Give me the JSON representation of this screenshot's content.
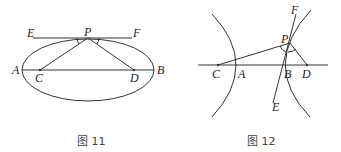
{
  "figures": [
    {
      "caption": "图 11",
      "type": "ellipse",
      "labels": {
        "E": "E",
        "P": "P",
        "F": "F",
        "A": "A",
        "B": "B",
        "C": "C",
        "D": "D"
      }
    },
    {
      "caption": "图 12",
      "type": "hyperbola",
      "labels": {
        "F": "F",
        "P": "P",
        "C": "C",
        "A": "A",
        "B": "B",
        "D": "D",
        "E": "E"
      }
    }
  ],
  "colors": {
    "line": "#333333",
    "text": "#222222"
  }
}
